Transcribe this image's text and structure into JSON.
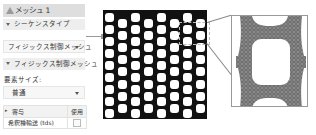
{
  "panel": {
    "title": "メッシュ 1",
    "title_icon": "warning-triangle-icon",
    "section1": "シーケンスタイプ",
    "sequence_type_value": "フィジックス制御メッシュ",
    "section2": "フィジックス制御メッシュ",
    "element_size_label": "要素サイズ:",
    "element_size_value": "普通",
    "table": {
      "headers": [
        "寄与",
        "使用"
      ],
      "rows": [
        {
          "name": "希釈種輸送 (tds)",
          "use": true
        }
      ]
    }
  },
  "graphics": {
    "pattern_color": "#111111",
    "mesh_color": "#7a7a7a",
    "grid": {
      "columns": 8,
      "rows_even": 9,
      "rows_odd": 8
    }
  }
}
